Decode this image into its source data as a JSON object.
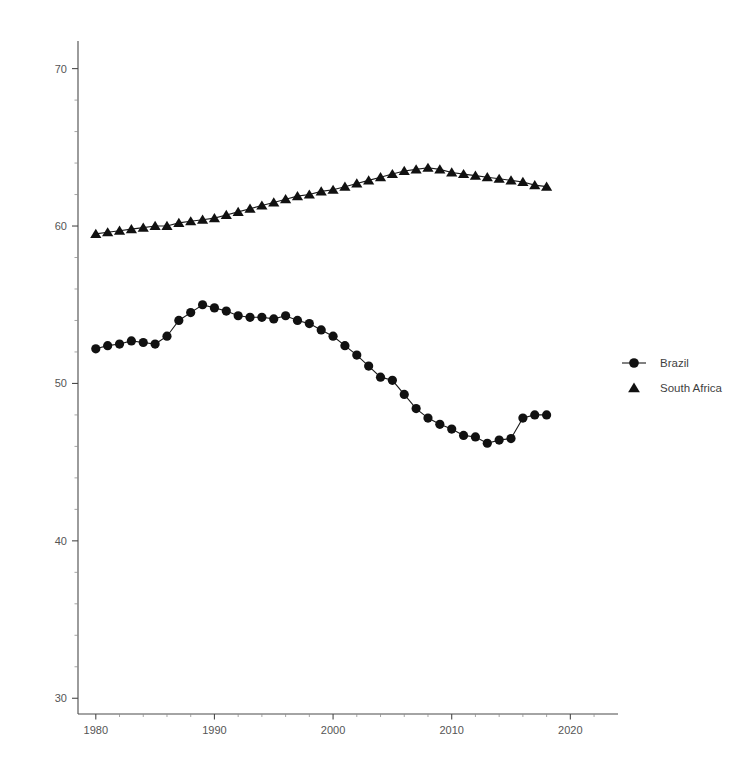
{
  "chart_data": {
    "type": "line",
    "title": "",
    "subtitle": "",
    "xlabel": "",
    "ylabel": "",
    "xlim": [
      1978.5,
      2022.5
    ],
    "ylim": [
      29.0,
      71.5
    ],
    "grid": false,
    "legend_position": "right",
    "x_ticks": [
      1980,
      1990,
      2000,
      2010,
      2020
    ],
    "x_tick_labels": [
      "1980",
      "1990",
      "2000",
      "2010",
      "2020"
    ],
    "x_minor_step": 2,
    "y_ticks": [
      30,
      40,
      50,
      60,
      70
    ],
    "y_tick_labels": [
      "30",
      "40",
      "50",
      "60",
      "70"
    ],
    "y_minor_step": 2,
    "x": [
      1980,
      1981,
      1982,
      1983,
      1984,
      1985,
      1986,
      1987,
      1988,
      1989,
      1990,
      1991,
      1992,
      1993,
      1994,
      1995,
      1996,
      1997,
      1998,
      1999,
      2000,
      2001,
      2002,
      2003,
      2004,
      2005,
      2006,
      2007,
      2008,
      2009,
      2010,
      2011,
      2012,
      2013,
      2014,
      2015,
      2016,
      2017,
      2018
    ],
    "series": [
      {
        "name": "Brazil",
        "marker": "circle",
        "color": "#111111",
        "values": [
          52.2,
          52.4,
          52.5,
          52.7,
          52.6,
          52.5,
          53.0,
          54.0,
          54.5,
          55.0,
          54.8,
          54.6,
          54.3,
          54.2,
          54.2,
          54.1,
          54.3,
          54.0,
          53.8,
          53.4,
          53.0,
          52.4,
          51.8,
          51.1,
          50.4,
          50.2,
          49.3,
          48.4,
          47.8,
          47.4,
          47.1,
          46.7,
          46.6,
          46.2,
          46.4,
          46.5,
          47.8,
          48.0,
          48.0
        ]
      },
      {
        "name": "South Africa",
        "marker": "triangle",
        "color": "#111111",
        "values": [
          59.5,
          59.6,
          59.7,
          59.8,
          59.9,
          60.0,
          60.0,
          60.2,
          60.3,
          60.4,
          60.5,
          60.7,
          60.9,
          61.1,
          61.3,
          61.5,
          61.7,
          61.9,
          62.0,
          62.2,
          62.3,
          62.5,
          62.7,
          62.9,
          63.1,
          63.3,
          63.5,
          63.6,
          63.7,
          63.6,
          63.4,
          63.3,
          63.2,
          63.1,
          63.0,
          62.9,
          62.8,
          62.6,
          62.5
        ]
      }
    ],
    "legend": [
      {
        "label": "Brazil",
        "marker": "circle"
      },
      {
        "label": "South Africa",
        "marker": "triangle"
      }
    ],
    "geometry": {
      "plot_left": 78,
      "plot_right": 600,
      "plot_top": 45,
      "plot_bottom": 714,
      "y_value_top": 71.5,
      "y_value_bottom": 29.0,
      "x_value_left": 1978.5,
      "x_value_right": 2022.5,
      "legend_x": 620,
      "legend_marker_x": 634,
      "legend_y_first": 363,
      "legend_row_gap": 25
    }
  }
}
